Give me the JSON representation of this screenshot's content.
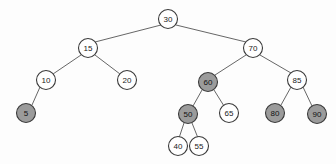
{
  "diagram": {
    "type": "binary-tree",
    "background_color": "#fdfdfd",
    "node_fill_white": "#ffffff",
    "node_fill_gray": "#9b9b9b",
    "node_stroke_color": "#3a3a3a",
    "edge_color": "#555555",
    "node_radius": 9.5,
    "nodes": [
      {
        "id": "n30",
        "label": "30",
        "x": 168,
        "y": 19,
        "shaded": false
      },
      {
        "id": "n15",
        "label": "15",
        "x": 88,
        "y": 48,
        "shaded": false
      },
      {
        "id": "n70",
        "label": "70",
        "x": 253,
        "y": 48,
        "shaded": false
      },
      {
        "id": "n10",
        "label": "10",
        "x": 46,
        "y": 80,
        "shaded": false
      },
      {
        "id": "n20",
        "label": "20",
        "x": 127,
        "y": 80,
        "shaded": false
      },
      {
        "id": "n60",
        "label": "60",
        "x": 208,
        "y": 82,
        "shaded": true
      },
      {
        "id": "n85",
        "label": "85",
        "x": 297,
        "y": 80,
        "shaded": false
      },
      {
        "id": "n5",
        "label": "5",
        "x": 26,
        "y": 113,
        "shaded": true
      },
      {
        "id": "n50",
        "label": "50",
        "x": 188,
        "y": 114,
        "shaded": true
      },
      {
        "id": "n65",
        "label": "65",
        "x": 229,
        "y": 113,
        "shaded": false
      },
      {
        "id": "n80",
        "label": "80",
        "x": 275,
        "y": 113,
        "shaded": true
      },
      {
        "id": "n90",
        "label": "90",
        "x": 317,
        "y": 114,
        "shaded": true
      },
      {
        "id": "n40",
        "label": "40",
        "x": 178,
        "y": 146,
        "shaded": false
      },
      {
        "id": "n55",
        "label": "55",
        "x": 199,
        "y": 146,
        "shaded": false
      }
    ],
    "edges": [
      {
        "id": "e30-15",
        "from": "n30",
        "to": "n15",
        "x1": 161,
        "y1": 25,
        "x2": 95,
        "y2": 42
      },
      {
        "id": "e30-70",
        "from": "n30",
        "to": "n70",
        "x1": 176,
        "y1": 25,
        "x2": 246,
        "y2": 42
      },
      {
        "id": "e15-10",
        "from": "n15",
        "to": "n10",
        "x1": 81,
        "y1": 55,
        "x2": 53,
        "y2": 74
      },
      {
        "id": "e15-20",
        "from": "n15",
        "to": "n20",
        "x1": 95,
        "y1": 55,
        "x2": 120,
        "y2": 74
      },
      {
        "id": "e10-5",
        "from": "n10",
        "to": "n5",
        "x1": 40,
        "y1": 87,
        "x2": 32,
        "y2": 105
      },
      {
        "id": "e70-60",
        "from": "n70",
        "to": "n60",
        "x1": 246,
        "y1": 55,
        "x2": 215,
        "y2": 75
      },
      {
        "id": "e70-85",
        "from": "n70",
        "to": "n85",
        "x1": 260,
        "y1": 55,
        "x2": 291,
        "y2": 73
      },
      {
        "id": "e60-50",
        "from": "n60",
        "to": "n50",
        "x1": 202,
        "y1": 90,
        "x2": 193,
        "y2": 106
      },
      {
        "id": "e60-65",
        "from": "n60",
        "to": "n65",
        "x1": 214,
        "y1": 90,
        "x2": 224,
        "y2": 106
      },
      {
        "id": "e50-40",
        "from": "n50",
        "to": "n40",
        "x1": 184,
        "y1": 123,
        "x2": 179,
        "y2": 138
      },
      {
        "id": "e50-55",
        "from": "n50",
        "to": "n55",
        "x1": 192,
        "y1": 123,
        "x2": 198,
        "y2": 138
      },
      {
        "id": "e85-80",
        "from": "n85",
        "to": "n80",
        "x1": 291,
        "y1": 87,
        "x2": 281,
        "y2": 105
      },
      {
        "id": "e85-90",
        "from": "n85",
        "to": "n90",
        "x1": 303,
        "y1": 87,
        "x2": 312,
        "y2": 106
      }
    ]
  }
}
